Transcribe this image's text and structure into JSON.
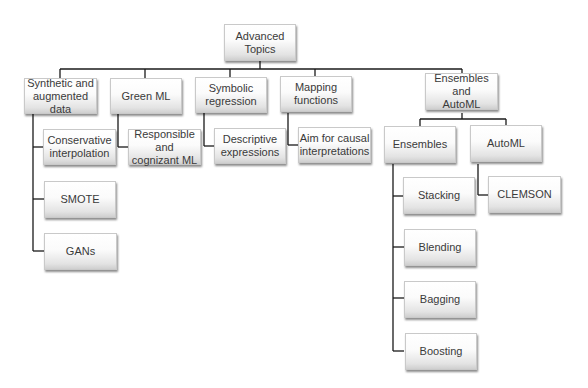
{
  "diagram": {
    "type": "hierarchy-tree",
    "root": {
      "label": "Advanced Topics",
      "children": [
        {
          "label": "Synthetic and augmented data",
          "children": [
            {
              "label": "Conservative interpolation"
            },
            {
              "label": "SMOTE"
            },
            {
              "label": "GANs"
            }
          ]
        },
        {
          "label": "Green ML",
          "children": [
            {
              "label": "Responsible and cognizant ML"
            }
          ]
        },
        {
          "label": "Symbolic regression",
          "children": [
            {
              "label": "Descriptive expressions"
            }
          ]
        },
        {
          "label": "Mapping functions",
          "children": [
            {
              "label": "Aim for causal interpretations"
            }
          ]
        },
        {
          "label": "Ensembles and AutoML",
          "children": [
            {
              "label": "Ensembles",
              "children": [
                {
                  "label": "Stacking"
                },
                {
                  "label": "Blending"
                },
                {
                  "label": "Bagging"
                },
                {
                  "label": "Boosting"
                }
              ]
            },
            {
              "label": "AutoML",
              "children": [
                {
                  "label": "CLEMSON"
                }
              ]
            }
          ]
        }
      ]
    }
  },
  "nodes": {
    "root": "Advanced\nTopics",
    "synthetic": "Synthetic and\naugmented data",
    "green": "Green ML",
    "symbolic": "Symbolic\nregression",
    "mapping": "Mapping\nfunctions",
    "ens_automl": "Ensembles and\nAutoML",
    "conservative": "Conservative\ninterpolation",
    "smote": "SMOTE",
    "gans": "GANs",
    "responsible": "Responsible and\ncognizant ML",
    "descriptive": "Descriptive\nexpressions",
    "causal": "Aim for causal\ninterpretations",
    "ensembles": "Ensembles",
    "automl": "AutoML",
    "stacking": "Stacking",
    "blending": "Blending",
    "bagging": "Bagging",
    "boosting": "Boosting",
    "clemson": "CLEMSON"
  },
  "colors": {
    "line": "#1a1a1a",
    "text": "#3a3a3a",
    "box_border": "#c9c9c9"
  }
}
